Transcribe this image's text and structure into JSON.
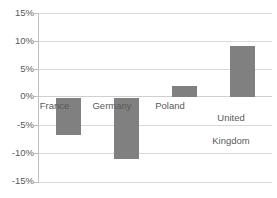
{
  "chart_data": {
    "type": "bar",
    "title": "",
    "xlabel": "",
    "ylabel": "",
    "categories": [
      "France",
      "Germany",
      "Poland",
      "United Kingdom"
    ],
    "values": [
      -6.7,
      -11.0,
      2.0,
      9.1
    ],
    "value_unit": "%",
    "ylim": [
      -15,
      15
    ],
    "ytick_labels": [
      "15%",
      "10%",
      "5%",
      "0%",
      "-5%",
      "-10%",
      "-15%"
    ],
    "ytick_values": [
      15,
      10,
      5,
      0,
      -5,
      -10,
      -15
    ],
    "grid": true,
    "legend": "none",
    "series": [
      {
        "name": "",
        "values": [
          -6.7,
          -11.0,
          2.0,
          9.1
        ],
        "color": "#808080"
      }
    ],
    "colors": {
      "bar": "#808080",
      "gridline": "#d9d9d9",
      "axis": "#bfbfbf",
      "text": "#595959",
      "background": "#ffffff"
    },
    "category_label_lines": [
      [
        "France"
      ],
      [
        "Germany"
      ],
      [
        "Poland"
      ],
      [
        "United",
        "Kingdom"
      ]
    ]
  }
}
